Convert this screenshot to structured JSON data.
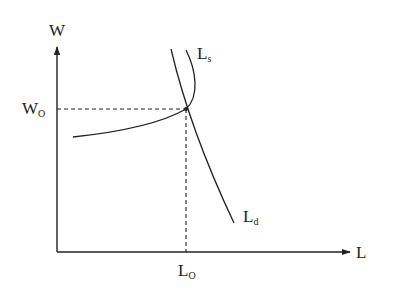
{
  "diagram": {
    "type": "labor market supply and demand diagram",
    "axes": {
      "y_label": "W",
      "x_label": "L"
    },
    "curves": [
      {
        "id": "supply",
        "label_main": "L",
        "label_sub": "s",
        "shape": "backward-bending"
      },
      {
        "id": "demand",
        "label_main": "L",
        "label_sub": "d",
        "shape": "downward-sloping"
      }
    ],
    "equilibrium": {
      "wage_label_main": "W",
      "wage_label_sub": "O",
      "quantity_label_main": "L",
      "quantity_label_sub": "O"
    },
    "colors": {
      "line": "#222222",
      "background": "#ffffff"
    }
  }
}
